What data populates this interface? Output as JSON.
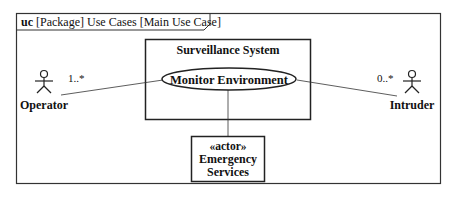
{
  "diagram": {
    "frame": {
      "kind": "uc",
      "title": "[Package] Use Cases [Main Use Case]"
    },
    "system_boundary": {
      "label": "Surveillance System"
    },
    "use_cases": [
      {
        "label": "Monitor Environment"
      }
    ],
    "actors": [
      {
        "label": "Operator",
        "multiplicity": "1..*"
      },
      {
        "label": "Intruder",
        "multiplicity": "0..*"
      }
    ],
    "actor_block": {
      "stereotype": "«actor»",
      "line1": "Emergency",
      "line2": "Services"
    },
    "colors": {
      "stroke": "#222222",
      "background": "#ffffff"
    }
  }
}
